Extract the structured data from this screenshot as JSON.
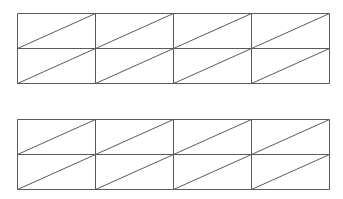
{
  "canvas": {
    "width": 343,
    "height": 199,
    "background": "#ffffff"
  },
  "style": {
    "stroke": "#5a5a5a",
    "stroke_width": 1
  },
  "grids": [
    {
      "name": "top-grid",
      "x0": 17,
      "y0": 13,
      "cols": 4,
      "rows": 2,
      "cell_width": 78,
      "cell_height": 35,
      "diagonal": "bottom-left-to-top-right"
    },
    {
      "name": "bottom-grid",
      "x0": 17,
      "y0": 119,
      "cols": 4,
      "rows": 2,
      "cell_width": 78,
      "cell_height": 35,
      "diagonal": "bottom-left-to-top-right"
    }
  ]
}
